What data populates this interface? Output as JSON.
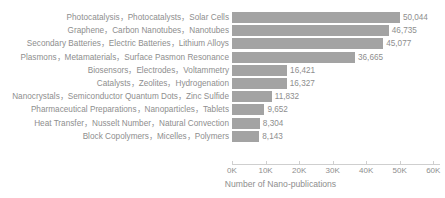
{
  "chart_data": {
    "type": "bar",
    "orientation": "horizontal",
    "title": "",
    "xlabel": "Number of Nano-publications",
    "ylabel": "",
    "xlim": [
      0,
      62000
    ],
    "grid": false,
    "legend": null,
    "bar_color": "#a3a3a3",
    "text_color": "#8e8e8e",
    "axis_color": "#cfcfcf",
    "tick_labels": [
      "0K",
      "10K",
      "20K",
      "30K",
      "40K",
      "50K",
      "60K"
    ],
    "tick_values": [
      0,
      10000,
      20000,
      30000,
      40000,
      50000,
      60000
    ],
    "categories": [
      "Photocatalysis，Photocatalysts，Solar Cells",
      "Graphene，Carbon Nanotubes，Nanotubes",
      "Secondary Batteries，Electric Batteries，Lithium Alloys",
      "Plasmons，Metamaterials，Surface Pasmon Resonance",
      "Biosensors，Electrodes，Voltammetry",
      "Catalysts，Zeolites，Hydrogenation",
      "Nanocrystals，Semiconductor Quantum Dots，Zinc Sulfide",
      "Pharmaceutical Preparations，Nanoparticles，Tablets",
      "Heat Transfer，Nusselt Number，Natural Convection",
      "Block Copolymers，Micelles，Polymers"
    ],
    "values": [
      50044,
      46735,
      45077,
      36665,
      16421,
      16327,
      11832,
      9652,
      8304,
      8143
    ],
    "value_labels": [
      "50,044",
      "46,735",
      "45,077",
      "36,665",
      "16,421",
      "16,327",
      "11,832",
      "9,652",
      "8,304",
      "8,143"
    ]
  }
}
